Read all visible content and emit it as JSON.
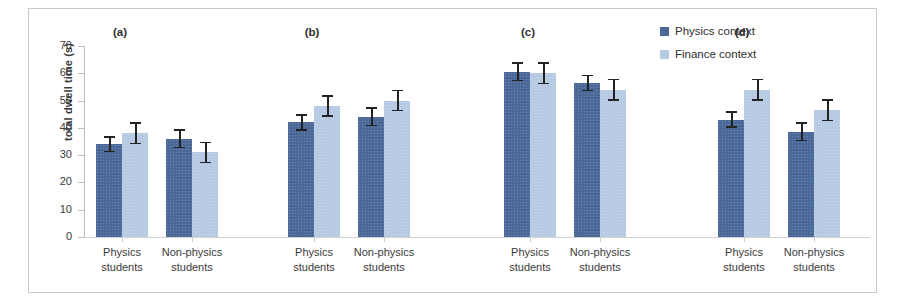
{
  "chart_data": {
    "type": "bar",
    "title": "",
    "xlabel": "",
    "ylabel": "total dwell time (s)",
    "ylim": [
      0,
      70
    ],
    "yticks": [
      0,
      10,
      20,
      30,
      40,
      50,
      60,
      70
    ],
    "grid": false,
    "legend_position": "top-right",
    "categories": [
      "Physics students",
      "Non-physics students"
    ],
    "legend": [
      "Physics context",
      "Finance context"
    ],
    "colors": {
      "physics_context": "#4a6898",
      "finance_context": "#b7cae4",
      "error_bar": "#232323",
      "axis": "#bfbfbf",
      "text": "#3a3a3a",
      "frame": "#c9c9c9"
    },
    "panels": [
      {
        "label": "(a)",
        "groups": [
          {
            "category": "Physics students",
            "bars": [
              {
                "series": "Physics context",
                "value": 34.0,
                "error": 3.0
              },
              {
                "series": "Finance context",
                "value": 38.0,
                "error": 4.0
              }
            ]
          },
          {
            "category": "Non-physics students",
            "bars": [
              {
                "series": "Physics context",
                "value": 36.0,
                "error": 3.5
              },
              {
                "series": "Finance context",
                "value": 31.0,
                "error": 4.0
              }
            ]
          }
        ]
      },
      {
        "label": "(b)",
        "groups": [
          {
            "category": "Physics students",
            "bars": [
              {
                "series": "Physics context",
                "value": 42.0,
                "error": 3.0
              },
              {
                "series": "Finance context",
                "value": 48.0,
                "error": 4.0
              }
            ]
          },
          {
            "category": "Non-physics students",
            "bars": [
              {
                "series": "Physics context",
                "value": 44.0,
                "error": 3.5
              },
              {
                "series": "Finance context",
                "value": 50.0,
                "error": 4.0
              }
            ]
          }
        ]
      },
      {
        "label": "(c)",
        "groups": [
          {
            "category": "Physics students",
            "bars": [
              {
                "series": "Physics context",
                "value": 60.5,
                "error": 3.5
              },
              {
                "series": "Finance context",
                "value": 60.0,
                "error": 4.0
              }
            ]
          },
          {
            "category": "Non-physics students",
            "bars": [
              {
                "series": "Physics context",
                "value": 56.5,
                "error": 3.0
              },
              {
                "series": "Finance context",
                "value": 54.0,
                "error": 4.0
              }
            ]
          }
        ]
      },
      {
        "label": "(d)",
        "groups": [
          {
            "category": "Physics students",
            "bars": [
              {
                "series": "Physics context",
                "value": 43.0,
                "error": 3.0
              },
              {
                "series": "Finance context",
                "value": 54.0,
                "error": 4.0
              }
            ]
          },
          {
            "category": "Non-physics students",
            "bars": [
              {
                "series": "Physics context",
                "value": 38.5,
                "error": 3.5
              },
              {
                "series": "Finance context",
                "value": 46.5,
                "error": 4.0
              }
            ]
          }
        ]
      }
    ]
  },
  "axis": {
    "ylabel": "total dwell time (s)",
    "ticks": [
      "70",
      "60",
      "50",
      "40",
      "30",
      "20",
      "10",
      "0"
    ]
  },
  "legend": {
    "items": [
      {
        "label": "Physics context",
        "swatch": "dark"
      },
      {
        "label": "Finance context",
        "swatch": "light"
      }
    ]
  },
  "panel_titles": [
    "(a)",
    "(b)",
    "(c)",
    "(d)"
  ],
  "group_labels": {
    "physics_line1": "Physics",
    "physics_line2": "students",
    "nonphysics_line1": "Non-physics",
    "nonphysics_line2": "students"
  }
}
